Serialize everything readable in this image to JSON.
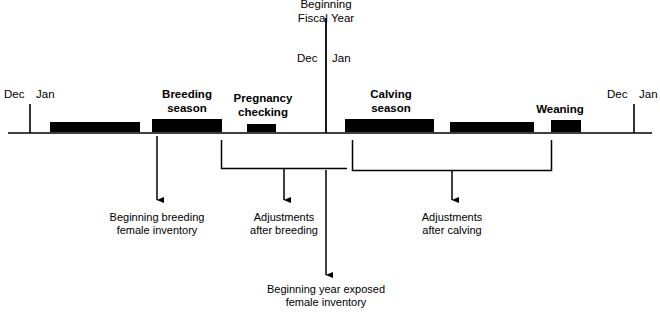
{
  "diagram": {
    "title_top": "Beginning\nFiscal Year",
    "title_top_line1": "Beginning",
    "title_top_line2": "Fiscal Year",
    "axis": {
      "y": 133,
      "x_start": 8,
      "x_end": 652,
      "color": "#000000"
    },
    "year_markers": [
      {
        "name": "left-year-boundary",
        "x": 30,
        "dec_label": "Dec",
        "jan_label": "Jan",
        "tick_top": 104,
        "tick_bottom": 133
      },
      {
        "name": "fiscal-year-boundary",
        "x": 326,
        "dec_label": "Dec",
        "jan_label": "Jan",
        "tick_top": 18,
        "tick_bottom": 133
      },
      {
        "name": "right-year-boundary",
        "x": 634,
        "dec_label": "Dec",
        "jan_label": "Jan",
        "tick_top": 104,
        "tick_bottom": 133
      }
    ],
    "bars": [
      {
        "name": "bar-unlabeled-1",
        "x": 50,
        "width": 90,
        "label": ""
      },
      {
        "name": "bar-breeding-season",
        "x": 152,
        "width": 70,
        "label": "Breeding\nseason",
        "label_line1": "Breeding",
        "label_line2": "season",
        "label_x": 187,
        "label_y": 90
      },
      {
        "name": "bar-pregnancy-checking",
        "x": 247,
        "width": 29,
        "label": "Pregnancy\nchecking",
        "label_line1": "Pregnancy",
        "label_line2": "checking",
        "label_x": 262,
        "label_y": 94
      },
      {
        "name": "bar-calving-season",
        "x": 345,
        "width": 89,
        "label": "Calving\nseason",
        "label_line1": "Calving",
        "label_line2": "season",
        "label_x": 390,
        "label_y": 90
      },
      {
        "name": "bar-unlabeled-2",
        "x": 450,
        "width": 84,
        "label": ""
      },
      {
        "name": "bar-weaning",
        "x": 551,
        "width": 30,
        "label": "Weaning",
        "label_line1": "Weaning",
        "label_line2": "",
        "label_x": 560,
        "label_y": 105
      }
    ],
    "arrows": [
      {
        "name": "arrow-beginning-breeding-female-inventory",
        "x": 157,
        "y_top": 136,
        "y_bottom": 203
      },
      {
        "name": "arrow-adjustments-after-breeding",
        "x": 284,
        "y_top": 169,
        "y_bottom": 203
      },
      {
        "name": "arrow-adjustments-after-calving",
        "x": 452,
        "y_top": 171,
        "y_bottom": 203
      },
      {
        "name": "arrow-beginning-year-exposed-female-inventory",
        "x": 326,
        "y_top": 170,
        "y_bottom": 278
      }
    ],
    "brackets": [
      {
        "name": "bracket-after-breeding",
        "x_left": 221,
        "x_right": 347,
        "y_top": 140,
        "y_bottom": 169
      },
      {
        "name": "bracket-after-calving",
        "x_left": 352,
        "x_right": 552,
        "y_top": 140,
        "y_bottom": 171
      }
    ],
    "annotations": [
      {
        "name": "annotation-beginning-breeding-female-inventory",
        "line1": "Beginning breeding",
        "line2": "female inventory",
        "x": 157,
        "y": 212
      },
      {
        "name": "annotation-adjustments-after-breeding",
        "line1": "Adjustments",
        "line2": "after breeding",
        "x": 284,
        "y": 212
      },
      {
        "name": "annotation-adjustments-after-calving",
        "line1": "Adjustments",
        "line2": "after calving",
        "x": 452,
        "y": 212
      },
      {
        "name": "annotation-beginning-year-exposed-female-inventory",
        "line1": "Beginning year exposed",
        "line2": "female inventory",
        "x": 326,
        "y": 284
      }
    ]
  }
}
